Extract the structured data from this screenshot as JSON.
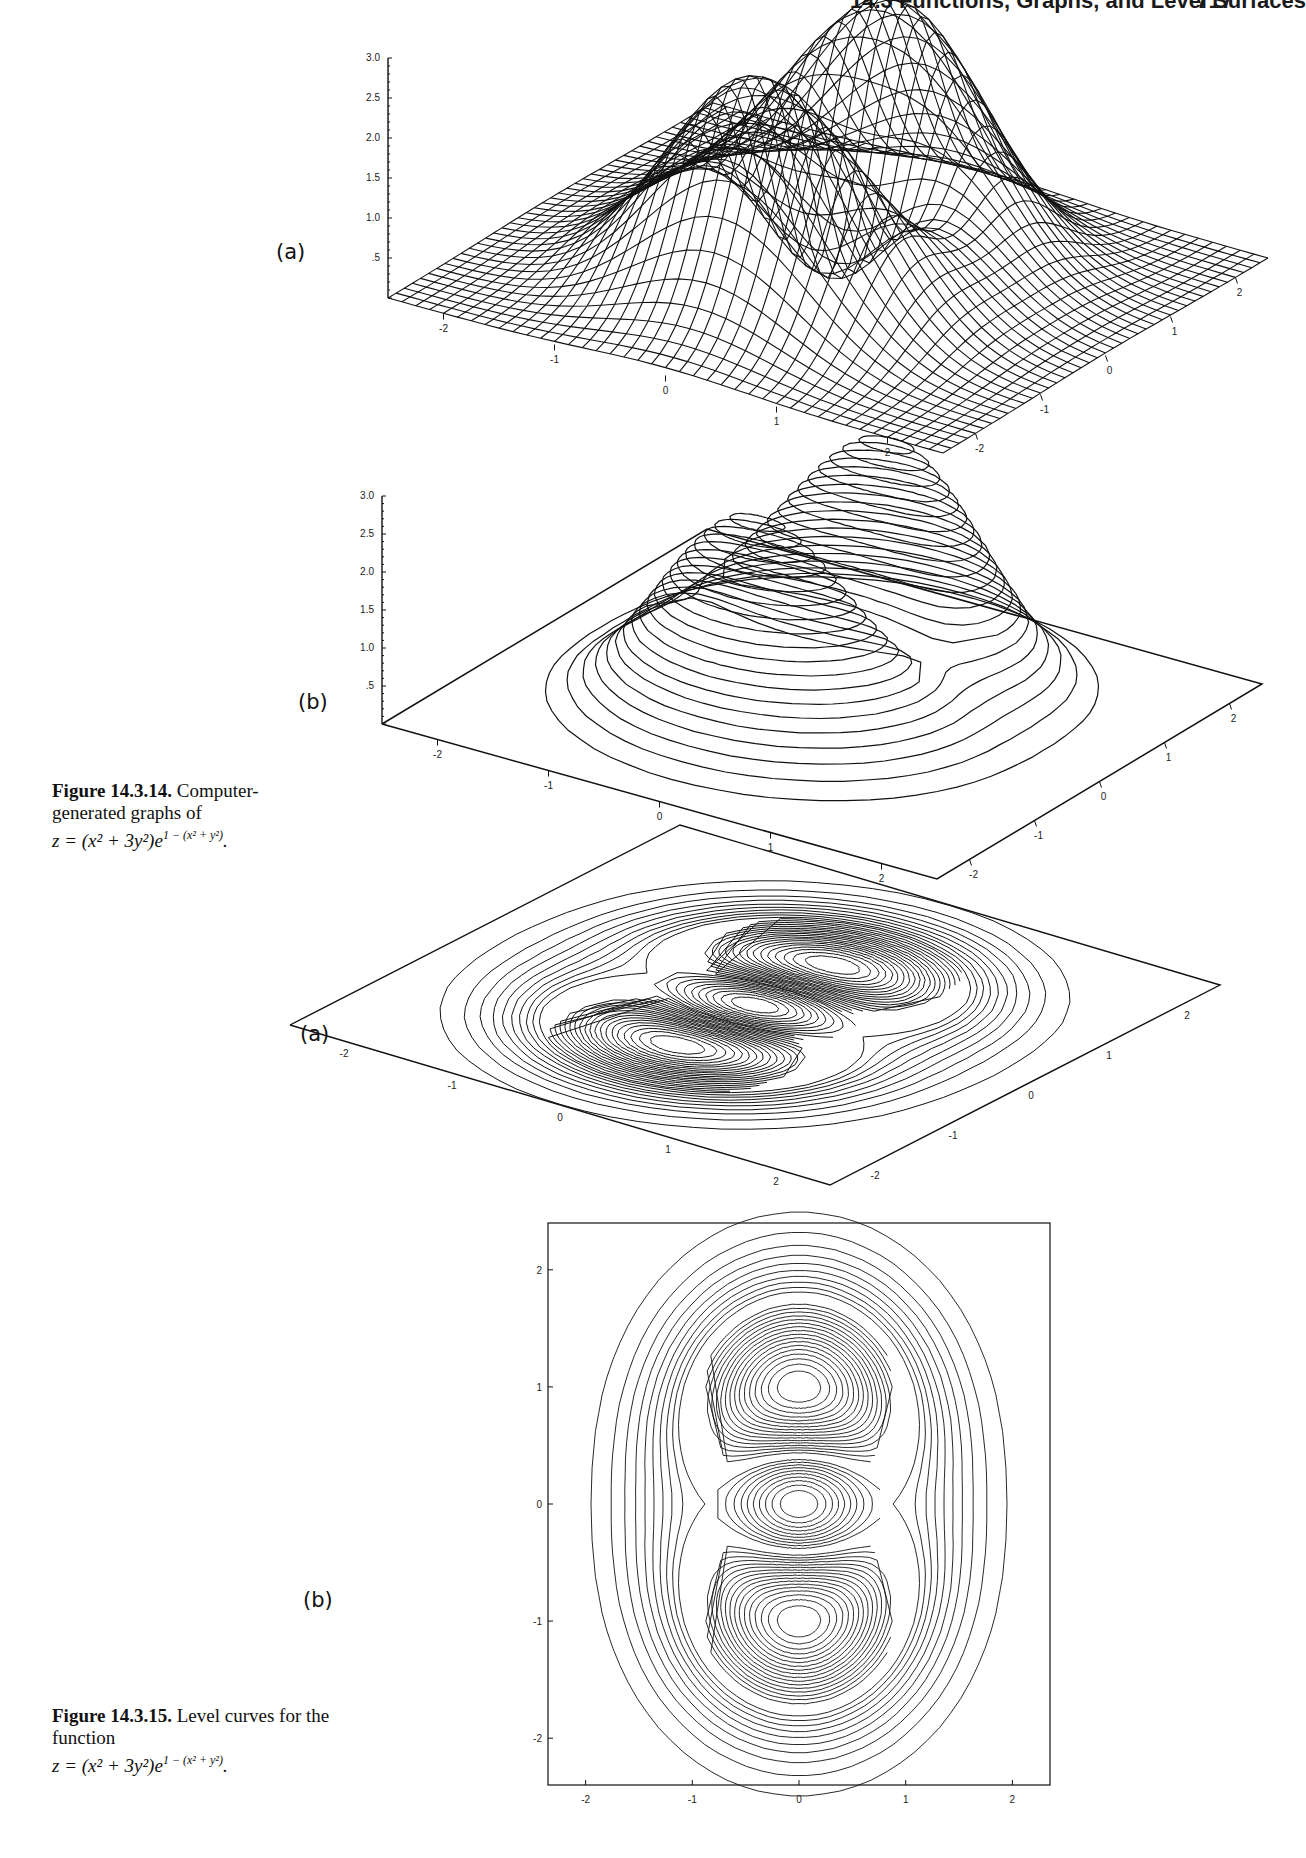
{
  "page": {
    "running_head": "14.3 Functions, Graphs, and Level Surfaces",
    "page_number": "717"
  },
  "figures": [
    {
      "id": "14.3.14",
      "caption": {
        "label": "Figure 14.3.14.",
        "text": "Computer-generated graphs of",
        "equation": "z = (x² + 3y²)e",
        "exponent": "1 − (x² + y²)",
        "end": "."
      },
      "panels": [
        {
          "label": "(a)",
          "kind": "wireframe-surface"
        },
        {
          "label": "(b)",
          "kind": "contour-surface"
        }
      ]
    },
    {
      "id": "14.3.15",
      "caption": {
        "label": "Figure 14.3.15.",
        "text": "Level curves for the function",
        "equation": "z = (x² + 3y²)e",
        "exponent": "1 − (x² + y²)",
        "end": "."
      },
      "panels": [
        {
          "label": "(a)",
          "kind": "contour-plane-perspective"
        },
        {
          "label": "(b)",
          "kind": "contour-2d"
        }
      ]
    }
  ],
  "chart_data": [
    {
      "type": "surface",
      "title": "Figure 14.3.14(a)",
      "function": "z = (x^2 + 3y^2) * exp(1 - (x^2 + y^2))",
      "style": "wireframe",
      "x_ticks": [
        "-2",
        "-1",
        "0",
        "1",
        "2"
      ],
      "y_ticks": [
        "-2",
        "-1",
        "0",
        "1",
        "2"
      ],
      "z_ticks": [
        ".5",
        "1.0",
        "1.5",
        "2.0",
        "2.5",
        "3.0"
      ],
      "xlim": [
        -2.5,
        2.5
      ],
      "ylim": [
        -2.5,
        2.5
      ],
      "zlim": [
        0,
        3.0
      ],
      "maxima": [
        {
          "x": 0,
          "y": 1,
          "z": 3.0
        },
        {
          "x": 0,
          "y": -1,
          "z": 3.0
        }
      ],
      "saddles": [
        {
          "x": 1,
          "y": 0,
          "z": 1.0
        },
        {
          "x": -1,
          "y": 0,
          "z": 1.0
        }
      ],
      "minimum": {
        "x": 0,
        "y": 0,
        "z": 0
      }
    },
    {
      "type": "surface",
      "title": "Figure 14.3.14(b)",
      "function": "z = (x^2 + 3y^2) * exp(1 - (x^2 + y^2))",
      "style": "contour lines on surface",
      "x_ticks": [
        "-2",
        "-1",
        "0",
        "1",
        "2"
      ],
      "y_ticks": [
        "-2",
        "-1",
        "0",
        "1",
        "2"
      ],
      "z_ticks": [
        ".5",
        "1.0",
        "1.5",
        "2.0",
        "2.5",
        "3.0"
      ],
      "contour_labels": [
        ".5",
        "1.0",
        "1.5",
        "2.0",
        "2.5"
      ],
      "zlim": [
        0,
        3.0
      ]
    },
    {
      "type": "contour",
      "title": "Figure 14.3.15(a)",
      "projection": "perspective plane",
      "x_ticks": [
        "-2",
        "-1",
        "0",
        "1",
        "2"
      ],
      "y_ticks": [
        "-2",
        "-1",
        "0",
        "1",
        "2"
      ],
      "levels_step": 0.1,
      "levels_range": [
        0.1,
        2.9
      ]
    },
    {
      "type": "contour",
      "title": "Figure 14.3.15(b)",
      "projection": "top view",
      "x_ticks": [
        "-2",
        "-1",
        "0",
        "1",
        "2"
      ],
      "y_ticks": [
        "-2",
        "-1",
        "0",
        "1",
        "2"
      ],
      "xlim": [
        -2.4,
        2.4
      ],
      "ylim": [
        -2.4,
        2.4
      ],
      "contour_labels": [
        "1.0",
        "1.5",
        "2.0",
        "2.5",
        ".5",
        "1.0",
        "1.5",
        "2.0",
        "2.5"
      ],
      "levels_step": 0.1,
      "levels_range": [
        0.1,
        2.9
      ]
    }
  ]
}
